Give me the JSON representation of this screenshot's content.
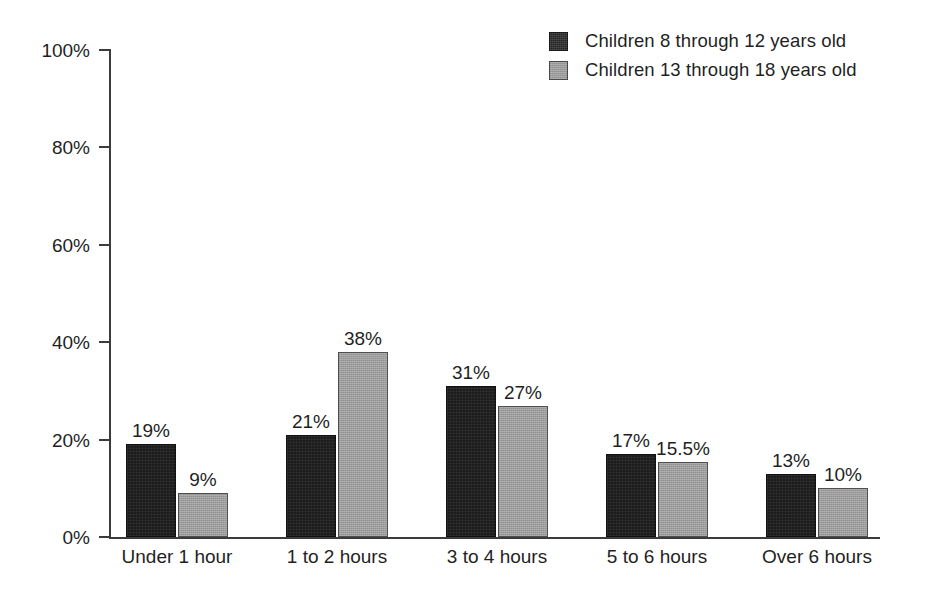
{
  "chart_data": {
    "type": "bar",
    "title": "",
    "subtitle": "",
    "xlabel": "",
    "ylabel": "",
    "ylim": [
      0,
      100
    ],
    "yticks": [
      "0%",
      "20%",
      "40%",
      "60%",
      "80%",
      "100%"
    ],
    "ytick_values": [
      0,
      20,
      40,
      60,
      80,
      100
    ],
    "grid": false,
    "legend_position": "top-right",
    "categories": [
      "Under 1 hour",
      "1 to 2 hours",
      "3 to 4 hours",
      "5 to 6 hours",
      "Over 6 hours"
    ],
    "series": [
      {
        "name": "Children 8 through 12 years old",
        "color": "#1c1c1c",
        "values": [
          19,
          21,
          31,
          17,
          13
        ],
        "labels": [
          "19%",
          "21%",
          "31%",
          "17%",
          "13%"
        ]
      },
      {
        "name": "Children 13 through 18 years old",
        "color": "#9d9d9d",
        "values": [
          9,
          38,
          27,
          15.5,
          10
        ],
        "labels": [
          "9%",
          "38%",
          "27%",
          "15.5%",
          "10%"
        ]
      }
    ]
  },
  "legend": {
    "items": [
      {
        "label": "Children 8 through 12 years old",
        "swatch": "dark"
      },
      {
        "label": "Children 13 through 18 years old",
        "swatch": "gray"
      }
    ]
  }
}
